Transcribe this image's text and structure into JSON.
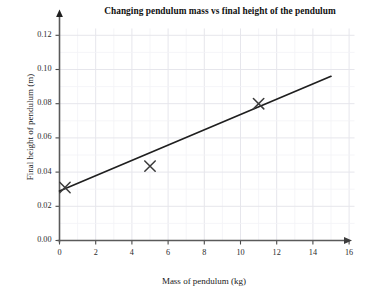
{
  "chart_data": {
    "type": "scatter",
    "title": "Changing pendulum mass vs final height of the pendulum",
    "xlabel": "Mass of pendulum (kg)",
    "ylabel": "Final height of pendulum (m)",
    "xlim": [
      0,
      16
    ],
    "ylim": [
      0.0,
      0.12
    ],
    "grid": true,
    "legend": "none",
    "xticks": [
      "0",
      "2",
      "4",
      "6",
      "8",
      "10",
      "12",
      "14",
      "16"
    ],
    "xtick_values": [
      0,
      2,
      4,
      6,
      8,
      10,
      12,
      14,
      16
    ],
    "yticks": [
      "0.00",
      "0.02",
      "0.04",
      "0.06",
      "0.08",
      "0.10",
      "0.12"
    ],
    "ytick_values": [
      0.0,
      0.02,
      0.04,
      0.06,
      0.08,
      0.1,
      0.12
    ],
    "marker": "x",
    "series": [
      {
        "name": "Measured data",
        "points": [
          {
            "x": 0.3,
            "y": 0.031
          },
          {
            "x": 5.0,
            "y": 0.0435
          },
          {
            "x": 11.0,
            "y": 0.08
          }
        ]
      },
      {
        "name": "Line of best fit",
        "type": "line",
        "points": [
          {
            "x": 0.0,
            "y": 0.029
          },
          {
            "x": 15.0,
            "y": 0.096
          }
        ]
      }
    ]
  },
  "style": {
    "background": "#ffffff",
    "axis_color": "#4a4a4a",
    "grid_color": "#ededf2",
    "line_color": "#1f1f1f",
    "marker_color": "#3a3a3a",
    "text_color": "#1a1a1a"
  }
}
